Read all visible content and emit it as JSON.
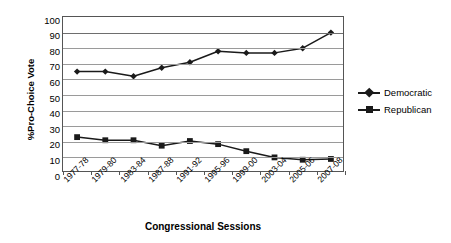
{
  "chart_data": {
    "type": "line",
    "title": "",
    "xlabel": "Congressional Sessions",
    "ylabel": "%Pro-Choice Vote",
    "ylim": [
      0,
      100
    ],
    "ytick_step": 10,
    "yticks": [
      "100",
      "90",
      "80",
      "70",
      "60",
      "50",
      "40",
      "30",
      "20",
      "10",
      "0"
    ],
    "grid": true,
    "legend_position": "right",
    "categories": [
      "1977-78",
      "1979-80",
      "1983-84",
      "1987-88",
      "1991-92",
      "1995-96",
      "1999-00",
      "2003-04",
      "2005-06",
      "2007-08"
    ],
    "series": [
      {
        "name": "Democratic",
        "marker": "diamond",
        "color": "#1a1a1a",
        "values": [
          65,
          65,
          62,
          67.5,
          71,
          78,
          77,
          77,
          80,
          90
        ]
      },
      {
        "name": "Republican",
        "marker": "square",
        "color": "#1a1a1a",
        "values": [
          23,
          21,
          21,
          17.5,
          20.5,
          18.5,
          14,
          10,
          8.5,
          9
        ]
      }
    ]
  },
  "legend": {
    "items": [
      {
        "label": "Democratic",
        "marker": "diamond"
      },
      {
        "label": "Republican",
        "marker": "square"
      }
    ]
  },
  "colors": {
    "series": "#1a1a1a",
    "gridline": "#9a9a9a",
    "axis": "#555555",
    "background": "#ffffff"
  }
}
